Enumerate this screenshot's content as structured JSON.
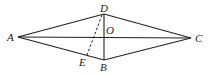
{
  "diagram": {
    "type": "geometry",
    "shape": "rhombus ABCD with diagonals AC and BD intersecting at O; dashed segment DE with E on AB",
    "points": {
      "A": {
        "label": "A",
        "x": 18,
        "y": 37
      },
      "B": {
        "label": "B",
        "x": 104,
        "y": 60
      },
      "C": {
        "label": "C",
        "x": 191,
        "y": 38
      },
      "D": {
        "label": "D",
        "x": 104,
        "y": 14
      },
      "O": {
        "label": "O",
        "x": 104,
        "y": 37
      },
      "E": {
        "label": "E",
        "x": 87,
        "y": 55
      }
    },
    "segments": [
      {
        "from": "A",
        "to": "D",
        "style": "solid"
      },
      {
        "from": "D",
        "to": "C",
        "style": "solid"
      },
      {
        "from": "C",
        "to": "B",
        "style": "solid"
      },
      {
        "from": "B",
        "to": "A",
        "style": "solid"
      },
      {
        "from": "A",
        "to": "C",
        "style": "solid"
      },
      {
        "from": "D",
        "to": "B",
        "style": "solid"
      },
      {
        "from": "D",
        "to": "E",
        "style": "dashed"
      }
    ],
    "labels": {
      "A": "A",
      "B": "B",
      "C": "C",
      "D": "D",
      "O": "O",
      "E": "E"
    }
  }
}
